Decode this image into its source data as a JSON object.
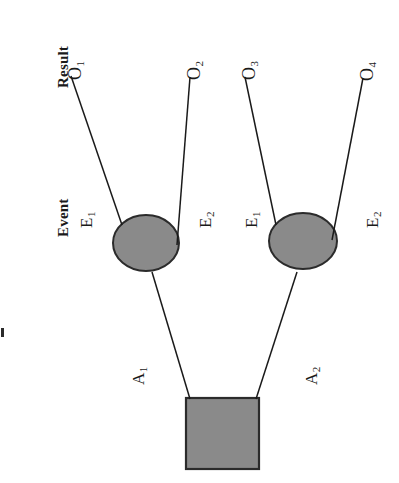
{
  "figure": {
    "orientation": "rotated-90-ccw",
    "background_color": "#ffffff",
    "line_color": "#1a1a1a",
    "node_fill_color": "#8a8a8a",
    "node_stroke_color": "#2b2b2b",
    "text_color": "#1a1a1a"
  },
  "columns": [
    {
      "id": "result",
      "label": "Result"
    },
    {
      "id": "event",
      "label": "Event"
    }
  ],
  "nodes": {
    "root": {
      "id": "root",
      "shape": "square",
      "kind": "decision-node",
      "label": ""
    },
    "chance": [
      {
        "id": "chance-1",
        "shape": "ellipse",
        "kind": "chance-node",
        "label": ""
      },
      {
        "id": "chance-2",
        "shape": "ellipse",
        "kind": "chance-node",
        "label": ""
      }
    ]
  },
  "action_branches": [
    {
      "id": "a1",
      "letter": "A",
      "sub": "1",
      "text": "A1"
    },
    {
      "id": "a2",
      "letter": "A",
      "sub": "2",
      "text": "A2"
    }
  ],
  "event_branches": [
    {
      "id": "e1a",
      "letter": "E",
      "sub": "1",
      "text": "E1"
    },
    {
      "id": "e2a",
      "letter": "E",
      "sub": "2",
      "text": "E2"
    },
    {
      "id": "e1b",
      "letter": "E",
      "sub": "1",
      "text": "E1"
    },
    {
      "id": "e2b",
      "letter": "E",
      "sub": "2",
      "text": "E2"
    }
  ],
  "outcomes": [
    {
      "id": "o1",
      "letter": "O",
      "sub": "1",
      "text": "O1"
    },
    {
      "id": "o2",
      "letter": "O",
      "sub": "2",
      "text": "O2"
    },
    {
      "id": "o3",
      "letter": "O",
      "sub": "3",
      "text": "O3"
    },
    {
      "id": "o4",
      "letter": "O",
      "sub": "4",
      "text": "O4"
    }
  ]
}
